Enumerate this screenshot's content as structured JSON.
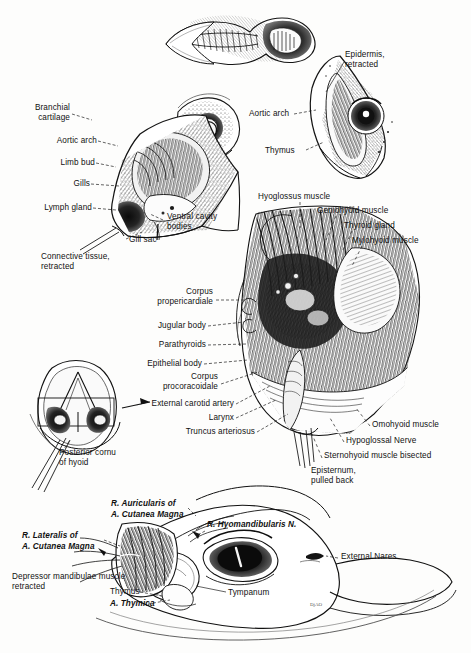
{
  "figure": {
    "signature": "DjAO"
  },
  "labels": {
    "tadpole_top": [],
    "larval_section": [
      {
        "id": "branchial-cartilage",
        "text": "Branchial\ncartilage",
        "x": 68,
        "y": 108,
        "align": "right"
      },
      {
        "id": "aortic-arch-left",
        "text": "Aortic arch",
        "x": 95,
        "y": 140,
        "align": "right"
      },
      {
        "id": "limb-bud",
        "text": "Limb bud",
        "x": 93,
        "y": 162,
        "align": "right"
      },
      {
        "id": "gills",
        "text": "Gills",
        "x": 88,
        "y": 183,
        "align": "right"
      },
      {
        "id": "lymph-gland",
        "text": "Lymph gland",
        "x": 90,
        "y": 207,
        "align": "right"
      },
      {
        "id": "ventral-cavity-bodies",
        "text": "Ventral cavity\nbodies",
        "x": 166,
        "y": 217,
        "align": "left"
      },
      {
        "id": "gill-sac",
        "text": "Gill sac",
        "x": 112,
        "y": 240,
        "align": "left"
      },
      {
        "id": "connective-tissue-retracted",
        "text": "Connective tissue,\nretracted",
        "x": 41,
        "y": 256,
        "align": "left"
      }
    ],
    "upper_right_section": [
      {
        "id": "epidermis-retracted",
        "text": "Epidermis,\nretracted",
        "x": 345,
        "y": 54,
        "align": "left"
      },
      {
        "id": "aortic-arch-right",
        "text": "Aortic arch",
        "x": 250,
        "y": 113,
        "align": "left"
      },
      {
        "id": "thymus-upper",
        "text": "Thymus",
        "x": 272,
        "y": 150,
        "align": "left"
      }
    ],
    "main_dissection_right": [
      {
        "id": "hyoglossus-muscle",
        "text": "Hyoglossus muscle",
        "x": 259,
        "y": 196,
        "align": "left"
      },
      {
        "id": "geniohyoid-muscle",
        "text": "Geniohyoid muscle",
        "x": 318,
        "y": 210,
        "align": "left"
      },
      {
        "id": "thyroid-gland",
        "text": "Thyroid gland",
        "x": 345,
        "y": 225,
        "align": "left"
      },
      {
        "id": "mylohyoid-muscle",
        "text": "Mylohyoid muscle",
        "x": 353,
        "y": 240,
        "align": "left"
      },
      {
        "id": "omohyoid-muscle",
        "text": "Omohyoid muscle",
        "x": 373,
        "y": 424,
        "align": "left"
      },
      {
        "id": "hypoglossal-nerve",
        "text": "Hypoglossal Nerve",
        "x": 347,
        "y": 440,
        "align": "left"
      },
      {
        "id": "sternohyoid-muscle-bisected",
        "text": "Sternohyoid muscle bisected",
        "x": 325,
        "y": 455,
        "align": "left"
      },
      {
        "id": "episternum-pulled-back",
        "text": "Episternum,\npulled back",
        "x": 311,
        "y": 470,
        "align": "left"
      }
    ],
    "main_dissection_left": [
      {
        "id": "corpus-propericardiale",
        "text": "Corpus\npropericardiale",
        "x": 212,
        "y": 292,
        "align": "right"
      },
      {
        "id": "jugular-body",
        "text": "Jugular body",
        "x": 205,
        "y": 325,
        "align": "right"
      },
      {
        "id": "parathyroids",
        "text": "Parathyroids",
        "x": 205,
        "y": 344,
        "align": "right"
      },
      {
        "id": "epithelial-body",
        "text": "Epithelial body",
        "x": 201,
        "y": 363,
        "align": "right"
      },
      {
        "id": "corpus-procoracoidale",
        "text": "Corpus\nprocoracoidale",
        "x": 217,
        "y": 376,
        "align": "right"
      },
      {
        "id": "external-carotid-artery",
        "text": "External carotid artery",
        "x": 233,
        "y": 403,
        "align": "right"
      },
      {
        "id": "larynx",
        "text": "Larynx",
        "x": 233,
        "y": 417,
        "align": "right"
      },
      {
        "id": "truncus-arteriosus",
        "text": "Truncus arteriosus",
        "x": 254,
        "y": 431,
        "align": "right"
      }
    ],
    "hyoid_inset": [
      {
        "id": "posterior-cornu-of-hyoid",
        "text": "Posterior cornu\nof hyoid",
        "x": 59,
        "y": 452,
        "align": "left"
      }
    ],
    "lateral_head_section": [
      {
        "id": "r-auricularis-of",
        "text": "R. Auricularis of",
        "x": 111,
        "y": 503,
        "align": "left",
        "style": "italic-mixed"
      },
      {
        "id": "a-cutanea-magna-1",
        "text": "A. Cutanea Magna",
        "x": 111,
        "y": 513,
        "align": "left",
        "style": "italic"
      },
      {
        "id": "r-lateralis-of",
        "text": "R. Lateralis of",
        "x": 22,
        "y": 535,
        "align": "left",
        "style": "italic-mixed"
      },
      {
        "id": "a-cutanea-magna-2",
        "text": "A. Cutanea Magna",
        "x": 22,
        "y": 546,
        "align": "left",
        "style": "italic"
      },
      {
        "id": "r-hyomandibularis-n",
        "text": "R. Hyomandibularis N.",
        "x": 208,
        "y": 524,
        "align": "left",
        "style": "italic"
      },
      {
        "id": "external-nares",
        "text": "External Nares",
        "x": 341,
        "y": 556,
        "align": "left"
      },
      {
        "id": "depressor-mandibulae-muscle",
        "text": "Depressor mandibulae muscle\nretracted",
        "x": 12,
        "y": 576,
        "align": "left"
      },
      {
        "id": "tympanum",
        "text": "Tympanum",
        "x": 228,
        "y": 592,
        "align": "left"
      },
      {
        "id": "thymus-lower",
        "text": "Thymus",
        "x": 110,
        "y": 591,
        "align": "left"
      },
      {
        "id": "a-thymica",
        "text": "A. Thymica",
        "x": 110,
        "y": 603,
        "align": "left",
        "style": "italic"
      }
    ]
  },
  "colors": {
    "ink": "#111111",
    "paper": "#fdfdfc",
    "leader": "#2a2a2a"
  }
}
